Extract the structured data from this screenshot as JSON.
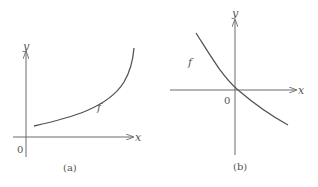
{
  "panels": [
    {
      "caption": "(a)",
      "x_axis_label": "x",
      "y_axis_label": "y",
      "origin_label": "0",
      "curve_label": "f",
      "curve_description": "increasing exponential-like curve, above x-axis"
    },
    {
      "caption": "(b)",
      "x_axis_label": "x",
      "y_axis_label": "y",
      "origin_label": "0",
      "curve_label": "f",
      "curve_description": "decreasing curve crossing both axes near origin"
    }
  ],
  "colors": {
    "axis": "#6a6a6a",
    "curve": "#555555",
    "text": "#555555"
  }
}
